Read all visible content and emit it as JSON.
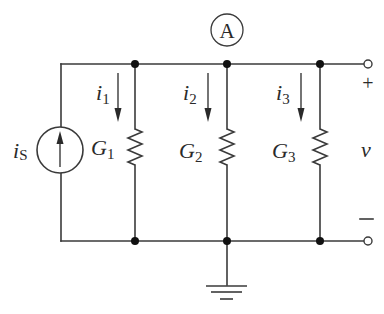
{
  "diagram": {
    "type": "parallel-conductance-circuit",
    "node_label": "A",
    "source": {
      "symbol": "i",
      "subscript": "S",
      "kind": "current-source",
      "direction": "up"
    },
    "branches": [
      {
        "current_symbol": "i",
        "current_sub": "1",
        "conductance_symbol": "G",
        "conductance_sub": "1"
      },
      {
        "current_symbol": "i",
        "current_sub": "2",
        "conductance_symbol": "G",
        "conductance_sub": "2"
      },
      {
        "current_symbol": "i",
        "current_sub": "3",
        "conductance_symbol": "G",
        "conductance_sub": "3"
      }
    ],
    "output": {
      "voltage_symbol": "v",
      "plus": "+",
      "minus": "—"
    },
    "ground": "ground-symbol",
    "colors": {
      "wire": "#3a3a3a",
      "node": "#111111",
      "background": "#ffffff"
    }
  }
}
